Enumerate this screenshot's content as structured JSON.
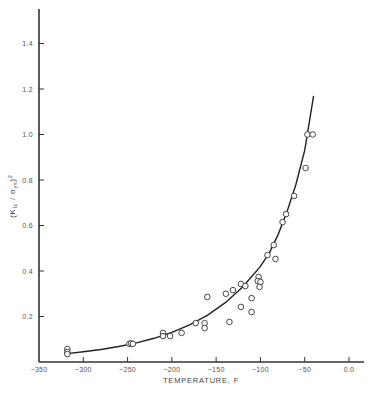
{
  "chart_data": {
    "type": "scatter",
    "title": "",
    "xlabel": "TEMPERATURE, F",
    "ylabel": "(K_Ic / σ_ys)²",
    "ylabel_parts": {
      "open": "(K",
      "sub1": "Ic",
      "mid": " / σ",
      "sub2": "ys",
      "close": ")",
      "sup": "2"
    },
    "xlim": [
      -350,
      0
    ],
    "ylim": [
      0,
      1.55
    ],
    "x_ticks": [
      -350,
      -300,
      -250,
      -200,
      -150,
      -100,
      -50,
      0
    ],
    "x_tick_labels": [
      "-350",
      "-300",
      "-250",
      "-200",
      "-150",
      "-100",
      "-50",
      "0.0"
    ],
    "y_ticks": [
      0.2,
      0.4,
      0.6,
      0.8,
      1.0,
      1.2,
      1.4
    ],
    "y_tick_labels": [
      "0.2",
      "0.4",
      "0.6",
      "0.8",
      "1.0",
      "1.2",
      "1.4"
    ],
    "grid": false,
    "legend": null,
    "series": [
      {
        "name": "data",
        "marker": "open-circle",
        "points": [
          [
            -318,
            0.057
          ],
          [
            -318,
            0.044
          ],
          [
            -318,
            0.035
          ],
          [
            -248,
            0.08
          ],
          [
            -246,
            0.082
          ],
          [
            -244,
            0.08
          ],
          [
            -210,
            0.128
          ],
          [
            -210,
            0.114
          ],
          [
            -202,
            0.114
          ],
          [
            -189,
            0.128
          ],
          [
            -173,
            0.171
          ],
          [
            -163,
            0.171
          ],
          [
            -163,
            0.149
          ],
          [
            -160,
            0.286
          ],
          [
            -139,
            0.3
          ],
          [
            -131,
            0.316
          ],
          [
            -135,
            0.176
          ],
          [
            -122,
            0.343
          ],
          [
            -122,
            0.242
          ],
          [
            -117,
            0.334
          ],
          [
            -110,
            0.281
          ],
          [
            -110,
            0.22
          ],
          [
            -102,
            0.374
          ],
          [
            -103,
            0.356
          ],
          [
            -100,
            0.352
          ],
          [
            -101,
            0.33
          ],
          [
            -92,
            0.47
          ],
          [
            -85,
            0.514
          ],
          [
            -83,
            0.453
          ],
          [
            -75,
            0.615
          ],
          [
            -71,
            0.65
          ],
          [
            -62,
            0.73
          ],
          [
            -49,
            0.853
          ],
          [
            -47,
            1.0
          ],
          [
            -41,
            1.0
          ]
        ]
      },
      {
        "name": "fit curve",
        "marker": "line",
        "points": [
          [
            -318,
            0.037
          ],
          [
            -300,
            0.045
          ],
          [
            -280,
            0.055
          ],
          [
            -260,
            0.068
          ],
          [
            -240,
            0.084
          ],
          [
            -220,
            0.104
          ],
          [
            -200,
            0.13
          ],
          [
            -180,
            0.163
          ],
          [
            -160,
            0.205
          ],
          [
            -140,
            0.26
          ],
          [
            -120,
            0.33
          ],
          [
            -100,
            0.42
          ],
          [
            -90,
            0.48
          ],
          [
            -80,
            0.56
          ],
          [
            -70,
            0.66
          ],
          [
            -60,
            0.78
          ],
          [
            -50,
            0.93
          ],
          [
            -40,
            1.17
          ]
        ]
      }
    ]
  }
}
